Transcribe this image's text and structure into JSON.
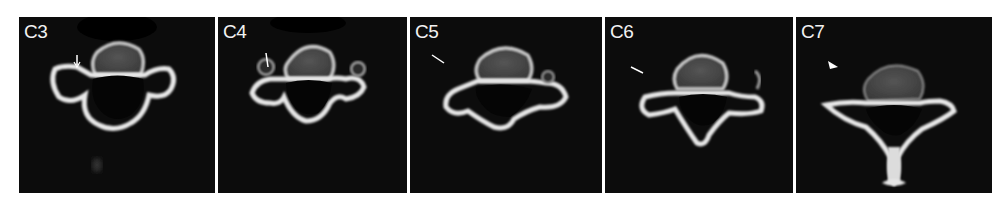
{
  "figure": {
    "panels": [
      {
        "label": "C3",
        "marker": "arrow"
      },
      {
        "label": "C4",
        "marker": "arrow"
      },
      {
        "label": "C5",
        "marker": "arrow"
      },
      {
        "label": "C6",
        "marker": "arrow"
      },
      {
        "label": "C7",
        "marker": "arrowhead"
      }
    ],
    "colors": {
      "background": "#ffffff",
      "panel": "#0c0c0c",
      "bone": "#e6e6e6",
      "soft_tissue": "#4a4a4a"
    }
  }
}
